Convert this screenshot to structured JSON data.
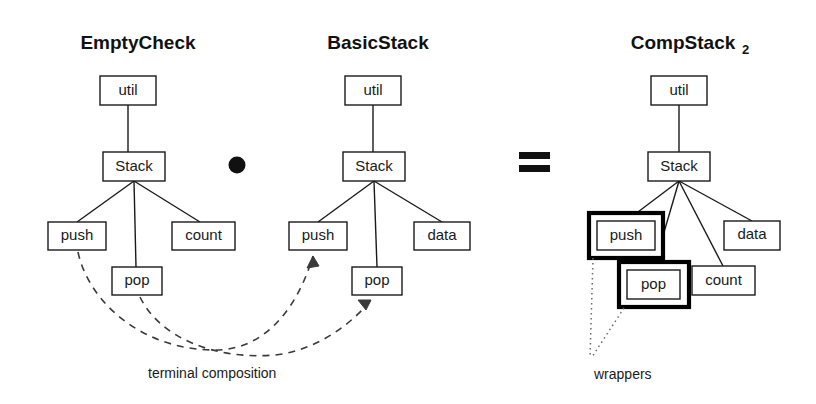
{
  "figure": {
    "background_color": "#ffffff",
    "line_color": "#1a1a1a",
    "wrapper_color": "#000000"
  },
  "trees": [
    {
      "id": "empty-check",
      "title": "EmptyCheck",
      "title_subscript": "",
      "nodes": [
        {
          "id": "util",
          "label": "util",
          "x": 100,
          "y": 76,
          "w": 56,
          "h": 29,
          "wrapped": false
        },
        {
          "id": "stack",
          "label": "Stack",
          "x": 103,
          "y": 152,
          "w": 62,
          "h": 29,
          "wrapped": false
        },
        {
          "id": "push",
          "label": "push",
          "x": 48,
          "y": 222,
          "w": 58,
          "h": 28,
          "wrapped": false
        },
        {
          "id": "pop",
          "label": "pop",
          "x": 112,
          "y": 267,
          "w": 50,
          "h": 28,
          "wrapped": false
        },
        {
          "id": "count",
          "label": "count",
          "x": 172,
          "y": 222,
          "w": 63,
          "h": 28,
          "wrapped": false
        }
      ],
      "edges": [
        {
          "from": "util",
          "to": "stack"
        },
        {
          "from": "stack",
          "to": "push"
        },
        {
          "from": "stack",
          "to": "pop"
        },
        {
          "from": "stack",
          "to": "count"
        }
      ]
    },
    {
      "id": "basic-stack",
      "title": "BasicStack",
      "title_subscript": "",
      "nodes": [
        {
          "id": "util",
          "label": "util",
          "x": 345,
          "y": 76,
          "w": 56,
          "h": 29,
          "wrapped": false
        },
        {
          "id": "stack",
          "label": "Stack",
          "x": 343,
          "y": 152,
          "w": 62,
          "h": 29,
          "wrapped": false
        },
        {
          "id": "push",
          "label": "push",
          "x": 289,
          "y": 222,
          "w": 58,
          "h": 28,
          "wrapped": false
        },
        {
          "id": "pop",
          "label": "pop",
          "x": 352,
          "y": 267,
          "w": 50,
          "h": 28,
          "wrapped": false
        },
        {
          "id": "data",
          "label": "data",
          "x": 414,
          "y": 222,
          "w": 56,
          "h": 28,
          "wrapped": false
        }
      ],
      "edges": [
        {
          "from": "util",
          "to": "stack"
        },
        {
          "from": "stack",
          "to": "push"
        },
        {
          "from": "stack",
          "to": "pop"
        },
        {
          "from": "stack",
          "to": "data"
        }
      ]
    },
    {
      "id": "comp-stack-2",
      "title": "CompStack",
      "title_subscript": "2",
      "nodes": [
        {
          "id": "util",
          "label": "util",
          "x": 651,
          "y": 76,
          "w": 56,
          "h": 29,
          "wrapped": false
        },
        {
          "id": "stack",
          "label": "Stack",
          "x": 648,
          "y": 152,
          "w": 62,
          "h": 29,
          "wrapped": false
        },
        {
          "id": "push",
          "label": "push",
          "x": 597,
          "y": 221,
          "w": 58,
          "h": 29,
          "wrapped": true,
          "wrapper": {
            "x": 589,
            "y": 213,
            "w": 74,
            "h": 45
          }
        },
        {
          "id": "pop",
          "label": "pop",
          "x": 627,
          "y": 270,
          "w": 53,
          "h": 29,
          "wrapped": true,
          "wrapper": {
            "x": 619,
            "y": 262,
            "w": 70,
            "h": 45
          }
        },
        {
          "id": "count",
          "label": "count",
          "x": 692,
          "y": 266,
          "w": 63,
          "h": 29,
          "wrapped": false
        },
        {
          "id": "data",
          "label": "data",
          "x": 724,
          "y": 221,
          "w": 56,
          "h": 29,
          "wrapped": false
        }
      ],
      "edges": [
        {
          "from": "util",
          "to": "stack"
        },
        {
          "from": "stack",
          "to": "push"
        },
        {
          "from": "stack",
          "to": "pop"
        },
        {
          "from": "stack",
          "to": "count"
        },
        {
          "from": "stack",
          "to": "data"
        }
      ]
    }
  ],
  "operators": [
    {
      "id": "compose",
      "symbol": "•",
      "name": "composition-dot",
      "x": 237,
      "y": 165
    },
    {
      "id": "equals",
      "symbol": "=",
      "name": "equals-sign",
      "x": 534,
      "y": 162
    }
  ],
  "annotations": [
    {
      "id": "terminal-composition",
      "label": "terminal composition",
      "x": 148,
      "y": 377,
      "style": "dashed-arrows",
      "arrows": [
        {
          "from": "EmptyCheck.push",
          "to": "BasicStack.push"
        },
        {
          "from": "EmptyCheck.pop",
          "to": "BasicStack.pop"
        }
      ]
    },
    {
      "id": "wrappers",
      "label": "wrappers",
      "x": 594,
      "y": 378,
      "style": "dotted-leaders",
      "leaders": [
        {
          "to": "CompStack2.push-wrapper"
        },
        {
          "to": "CompStack2.pop-wrapper"
        }
      ]
    }
  ]
}
